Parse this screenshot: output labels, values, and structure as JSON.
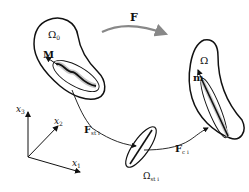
{
  "diagram": {
    "map_label": "F",
    "reference_body": {
      "domain_label": "Ω",
      "domain_subscript": "0",
      "vector_label": "M"
    },
    "current_body": {
      "domain_label": "Ω",
      "vector_label": "m"
    },
    "stress_free_body": {
      "domain_label": "Ω",
      "domain_subscript": "st i"
    },
    "map_to_stress_free": {
      "label": "F",
      "subscript": "st i"
    },
    "map_to_current": {
      "label": "F",
      "subscript": "c i"
    },
    "axes": {
      "x1": {
        "label": "x",
        "subscript": "1"
      },
      "x2": {
        "label": "x",
        "subscript": "2"
      },
      "x3": {
        "label": "x",
        "subscript": "3"
      }
    }
  },
  "colors": {
    "stroke": "#111111",
    "gray": "#8a8a8a",
    "light_gray": "#c8c8c8"
  }
}
